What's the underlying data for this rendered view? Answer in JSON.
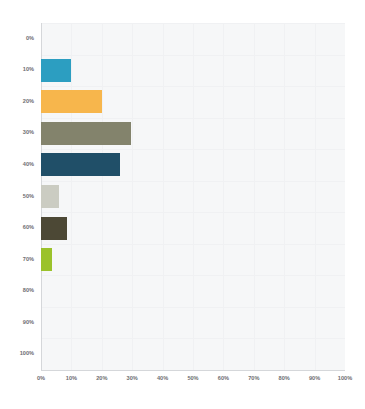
{
  "chart_data": {
    "type": "bar",
    "orientation": "horizontal",
    "title": "",
    "subtitle": "",
    "xlabel": "",
    "ylabel": "",
    "categories": [
      "0%",
      "10%",
      "20%",
      "30%",
      "40%",
      "50%",
      "60%",
      "70%",
      "80%",
      "90%",
      "100%"
    ],
    "values": [
      0,
      10,
      20,
      29.5,
      26,
      6,
      8.5,
      3.5,
      0,
      0,
      0
    ],
    "value_suffix": "%",
    "xlim": [
      0,
      100
    ],
    "x_ticks": [
      "0%",
      "10%",
      "20%",
      "30%",
      "40%",
      "50%",
      "60%",
      "70%",
      "80%",
      "90%",
      "100%"
    ],
    "x_tick_values": [
      0,
      10,
      20,
      30,
      40,
      50,
      60,
      70,
      80,
      90,
      100
    ],
    "y_ticks": [
      "0%",
      "10%",
      "20%",
      "30%",
      "40%",
      "50%",
      "60%",
      "70%",
      "80%",
      "90%",
      "100%"
    ],
    "grid": true,
    "legend": false,
    "legend_position": "none",
    "series": [
      {
        "name": "Response share",
        "values": [
          0,
          10,
          20,
          29.5,
          26,
          6,
          8.5,
          3.5,
          0,
          0,
          0
        ]
      }
    ],
    "bar_colors": [
      "#f6f7f8",
      "#2c9ec1",
      "#f7b64c",
      "#83836c",
      "#204f68",
      "#cbccc2",
      "#4c4835",
      "#9bc22b",
      "#f6f7f8",
      "#f6f7f8",
      "#f6f7f8"
    ]
  },
  "style": {
    "plot_background": "#f6f7f8",
    "page_background": "#ffffff",
    "gridline_color": "#f0f1f3",
    "axis_color": "#d5d7da",
    "tick_label_color": "#6d6e71"
  }
}
